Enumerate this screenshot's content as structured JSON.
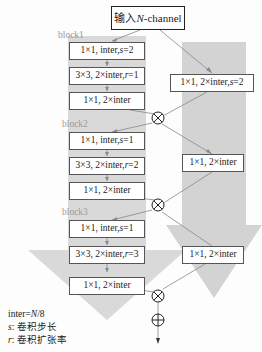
{
  "input": {
    "prefix": "输入 ",
    "var": "N",
    "suffix": "-channel"
  },
  "blocks": [
    {
      "label": "block1",
      "layers": [
        {
          "text": "1×1, inter, ",
          "var": "s",
          "val": "=2"
        },
        {
          "text": "3×3, 2×inter, ",
          "var": "r",
          "val": "=1"
        },
        {
          "text": "1×1, 2×inter",
          "var": "",
          "val": ""
        }
      ],
      "shortcut": {
        "text": "1×1, 2×inter, ",
        "var": "s",
        "val": "=2"
      }
    },
    {
      "label": "block2",
      "layers": [
        {
          "text": "1×1, inter, ",
          "var": "s",
          "val": "=1"
        },
        {
          "text": "3×3, 2×inter, ",
          "var": "r",
          "val": "=2"
        },
        {
          "text": "1×1, 2×inter",
          "var": "",
          "val": ""
        }
      ],
      "shortcut": {
        "text": "1×1, 2×inter",
        "var": "",
        "val": ""
      }
    },
    {
      "label": "block3",
      "layers": [
        {
          "text": "1×1, inter, ",
          "var": "s",
          "val": "=1"
        },
        {
          "text": "3×3, 2×inter, ",
          "var": "r",
          "val": "=3"
        },
        {
          "text": "1×1, 2×inter",
          "var": "",
          "val": ""
        }
      ],
      "shortcut": {
        "text": "1×1, 2×inter",
        "var": "",
        "val": ""
      }
    }
  ],
  "legend": {
    "inter_prefix": "inter=",
    "inter_var": "N",
    "inter_suffix": "/8",
    "s_var": "s",
    "s_desc": ": 卷积步长",
    "r_var": "r",
    "r_desc": ": 卷积扩张率"
  },
  "colors": {
    "arrow_bg": "#d6d6d6",
    "line": "#777777",
    "box_border": "#555555"
  }
}
